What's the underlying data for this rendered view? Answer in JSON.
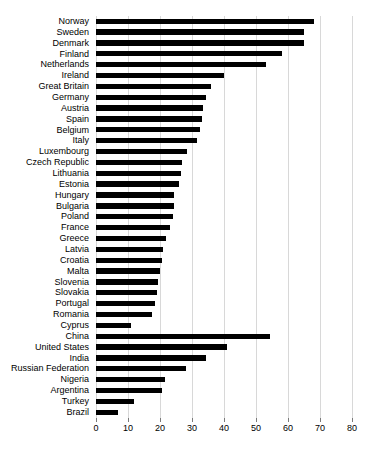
{
  "chart_data": {
    "type": "bar",
    "orientation": "horizontal",
    "title": "",
    "xlabel": "",
    "ylabel": "",
    "xlim": [
      0,
      80
    ],
    "xticks": [
      0,
      10,
      20,
      30,
      40,
      50,
      60,
      70,
      80
    ],
    "grid": true,
    "legend": null,
    "bar_color": "#000000",
    "grid_color": "#d8d8d8",
    "categories": [
      "Norway",
      "Sweden",
      "Denmark",
      "Finland",
      "Netherlands",
      "Ireland",
      "Great Britain",
      "Germany",
      "Austria",
      "Spain",
      "Belgium",
      "Italy",
      "Luxembourg",
      "Czech Republic",
      "Lithuania",
      "Estonia",
      "Hungary",
      "Bulgaria",
      "Poland",
      "France",
      "Greece",
      "Latvia",
      "Croatia",
      "Malta",
      "Slovenia",
      "Slovakia",
      "Portugal",
      "Romania",
      "Cyprus",
      "China",
      "United States",
      "India",
      "Russian Federation",
      "Nigeria",
      "Argentina",
      "Turkey",
      "Brazil"
    ],
    "values": [
      68.0,
      65.0,
      65.0,
      58.0,
      53.0,
      40.0,
      36.0,
      34.5,
      33.5,
      33.0,
      32.5,
      31.5,
      28.5,
      27.0,
      26.5,
      26.0,
      24.5,
      24.5,
      24.0,
      23.0,
      22.0,
      21.0,
      20.5,
      20.0,
      19.5,
      19.0,
      18.5,
      17.5,
      11.0,
      54.5,
      41.0,
      34.5,
      28.0,
      21.5,
      20.5,
      12.0,
      7.0
    ]
  }
}
